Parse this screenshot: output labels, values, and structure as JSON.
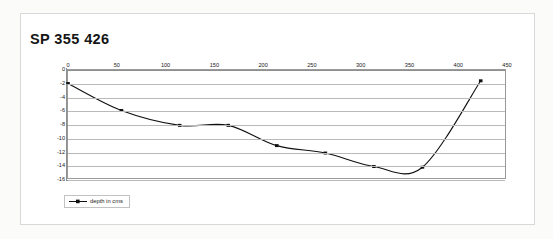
{
  "page": {
    "background_color": "#fbfbfa",
    "frame_border_color": "#d8d8d8"
  },
  "chart_title": "SP 355 426",
  "legend": {
    "entries": [
      {
        "label": "depth in cms",
        "color": "#101010",
        "marker": "square"
      }
    ]
  },
  "chart_data": {
    "type": "line",
    "title": "SP 355 426",
    "xlabel": "",
    "ylabel": "",
    "xlim": [
      0,
      450
    ],
    "ylim": [
      -16,
      0
    ],
    "xticks": [
      0,
      50,
      100,
      150,
      200,
      250,
      300,
      350,
      400,
      450
    ],
    "xtick_labels": [
      "0",
      "50",
      "100",
      "150",
      "200",
      "250",
      "300",
      "350",
      "400",
      "450"
    ],
    "yticks": [
      0,
      -2,
      -4,
      -6,
      -8,
      -10,
      -12,
      -14,
      -16
    ],
    "ytick_labels": [
      "0",
      "-2",
      "-4",
      "-6",
      "-8",
      "-10",
      "-12",
      "-14",
      "-16"
    ],
    "xaxis_position": "top",
    "grid": "horizontal",
    "grid_color": "#b9b9b9",
    "line_color": "#101010",
    "smoothing": "spline",
    "series": [
      {
        "name": "depth in cms",
        "marker": "square",
        "color": "#101010",
        "x": [
          0,
          55,
          115,
          165,
          215,
          265,
          315,
          365,
          425
        ],
        "values": [
          -2.0,
          -6.0,
          -8.2,
          -8.2,
          -11.2,
          -12.3,
          -14.3,
          -14.4,
          -1.6
        ]
      }
    ],
    "annotations": [
      {
        "text": "curve minimum approx -15.5 near x=340"
      }
    ]
  }
}
